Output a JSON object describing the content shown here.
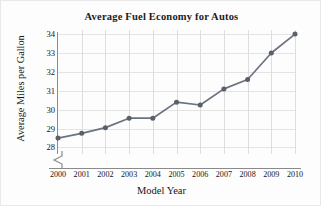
{
  "chart_data": {
    "type": "line",
    "title": "Average Fuel Economy for Autos",
    "xlabel": "Model Year",
    "ylabel": "Average Miles per Gallon",
    "categories": [
      "2000",
      "2001",
      "2002",
      "2003",
      "2004",
      "2005",
      "2006",
      "2007",
      "2008",
      "2009",
      "2010"
    ],
    "x": [
      2000,
      2001,
      2002,
      2003,
      2004,
      2005,
      2006,
      2007,
      2008,
      2009,
      2010
    ],
    "values": [
      28.5,
      28.75,
      29.05,
      29.55,
      29.55,
      30.4,
      30.25,
      31.1,
      31.6,
      33.0,
      34.0
    ],
    "series": [
      {
        "name": "Average Miles per Gallon",
        "values": [
          28.5,
          28.75,
          29.05,
          29.55,
          29.55,
          30.4,
          30.25,
          31.1,
          31.6,
          33.0,
          34.0
        ]
      }
    ],
    "ytick_labels": [
      "28",
      "29",
      "30",
      "31",
      "32",
      "33",
      "34"
    ],
    "yticks": [
      28,
      29,
      30,
      31,
      32,
      33,
      34
    ],
    "ylim": [
      28,
      34
    ],
    "xlim": [
      2000,
      2010
    ],
    "grid": true,
    "legend": false,
    "axis_break_y": true,
    "line_color": "#6b7280",
    "marker_color": "#5a6068",
    "grid_color": "#dededf",
    "axis_color": "#8a8a8a",
    "background_color": "#fdfdfd"
  }
}
